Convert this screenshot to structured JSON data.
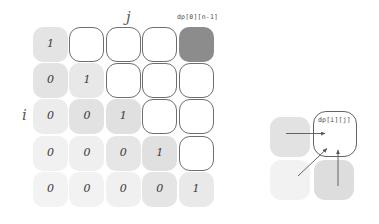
{
  "diagram": {
    "title_labels": {
      "column_axis": "j",
      "row_axis": "i"
    },
    "annotations": {
      "top_right_cell": "dp[0][n-1]",
      "target_cell": "dp[i][j]"
    },
    "grid": {
      "rows": 5,
      "cols": 5,
      "cells": [
        [
          {
            "value": "1",
            "state": "filled",
            "shade": "#e4e4e4"
          },
          {
            "value": "",
            "state": "empty",
            "shade": "#ffffff"
          },
          {
            "value": "",
            "state": "empty",
            "shade": "#ffffff"
          },
          {
            "value": "",
            "state": "empty",
            "shade": "#ffffff"
          },
          {
            "value": "",
            "state": "dark",
            "shade": "#8c8c8c"
          }
        ],
        [
          {
            "value": "0",
            "state": "filled",
            "shade": "#e3e3e3"
          },
          {
            "value": "1",
            "state": "filled",
            "shade": "#e8e8e8"
          },
          {
            "value": "",
            "state": "empty",
            "shade": "#ffffff"
          },
          {
            "value": "",
            "state": "empty",
            "shade": "#ffffff"
          },
          {
            "value": "",
            "state": "empty",
            "shade": "#ffffff"
          }
        ],
        [
          {
            "value": "0",
            "state": "filled",
            "shade": "#ececec"
          },
          {
            "value": "0",
            "state": "filled",
            "shade": "#e2e2e2"
          },
          {
            "value": "1",
            "state": "filled",
            "shade": "#e0e0e0"
          },
          {
            "value": "",
            "state": "empty",
            "shade": "#ffffff"
          },
          {
            "value": "",
            "state": "empty",
            "shade": "#ffffff"
          }
        ],
        [
          {
            "value": "0",
            "state": "filled",
            "shade": "#f1f1f1"
          },
          {
            "value": "0",
            "state": "filled",
            "shade": "#efefef"
          },
          {
            "value": "0",
            "state": "filled",
            "shade": "#e6e6e6"
          },
          {
            "value": "1",
            "state": "filled",
            "shade": "#e0e0e0"
          },
          {
            "value": "",
            "state": "empty",
            "shade": "#ffffff"
          }
        ],
        [
          {
            "value": "0",
            "state": "filled",
            "shade": "#f3f3f3"
          },
          {
            "value": "0",
            "state": "filled",
            "shade": "#f2f2f2"
          },
          {
            "value": "0",
            "state": "filled",
            "shade": "#f0f0f0"
          },
          {
            "value": "0",
            "state": "filled",
            "shade": "#e5e5e5"
          },
          {
            "value": "1",
            "state": "filled",
            "shade": "#e9e9e9"
          }
        ]
      ]
    },
    "detail": {
      "cells": [
        {
          "name": "left-neighbour",
          "shade": "#e2e2e2"
        },
        {
          "name": "diagonal-neighbour",
          "shade": "#f2f2f2"
        },
        {
          "name": "bottom-neighbour",
          "shade": "#dddddd"
        },
        {
          "name": "target",
          "shade": "#ffffff"
        }
      ],
      "arrows": [
        "from-left",
        "from-diagonal",
        "from-below"
      ]
    },
    "colors": {
      "ink": "#3a3a3a",
      "outline": "#6e6e6e",
      "highlight": "#8c8c8c",
      "paper": "#ffffff"
    }
  }
}
